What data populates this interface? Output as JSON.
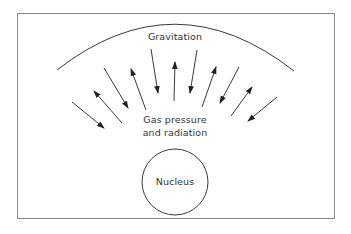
{
  "labels": {
    "gravitation": "Gravitation",
    "gas_pressure_line1": "Gas pressure",
    "gas_pressure_line2": "and radiation",
    "nucleus": "Nucleus"
  },
  "colors": {
    "stroke": "#222222",
    "frame": "#8a8a8a",
    "text": "#333333"
  },
  "arrows": [
    {
      "from": [
        72,
        102
      ],
      "to": [
        104,
        128
      ],
      "direction": "inward"
    },
    {
      "from": [
        122,
        123
      ],
      "to": [
        94,
        91
      ],
      "direction": "outward"
    },
    {
      "from": [
        104,
        68
      ],
      "to": [
        128,
        108
      ],
      "direction": "inward"
    },
    {
      "from": [
        146,
        110
      ],
      "to": [
        131,
        69
      ],
      "direction": "outward"
    },
    {
      "from": [
        151,
        49
      ],
      "to": [
        158,
        93
      ],
      "direction": "inward"
    },
    {
      "from": [
        174,
        101
      ],
      "to": [
        175,
        62
      ],
      "direction": "outward"
    },
    {
      "from": [
        197,
        50
      ],
      "to": [
        190,
        93
      ],
      "direction": "inward"
    },
    {
      "from": [
        202,
        107
      ],
      "to": [
        216,
        67
      ],
      "direction": "outward"
    },
    {
      "from": [
        239,
        67
      ],
      "to": [
        220,
        103
      ],
      "direction": "inward"
    },
    {
      "from": [
        231,
        116
      ],
      "to": [
        252,
        87
      ],
      "direction": "outward"
    },
    {
      "from": [
        277,
        97
      ],
      "to": [
        248,
        121
      ],
      "direction": "inward"
    }
  ]
}
